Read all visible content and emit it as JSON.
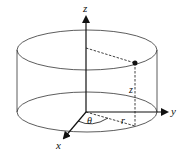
{
  "diagram": {
    "labels": {
      "z_axis": "z",
      "y_axis": "y",
      "x_axis": "x",
      "theta": "θ",
      "r": "r",
      "z_height": "z"
    },
    "colors": {
      "stroke": "#111111",
      "background": "#ffffff"
    }
  }
}
